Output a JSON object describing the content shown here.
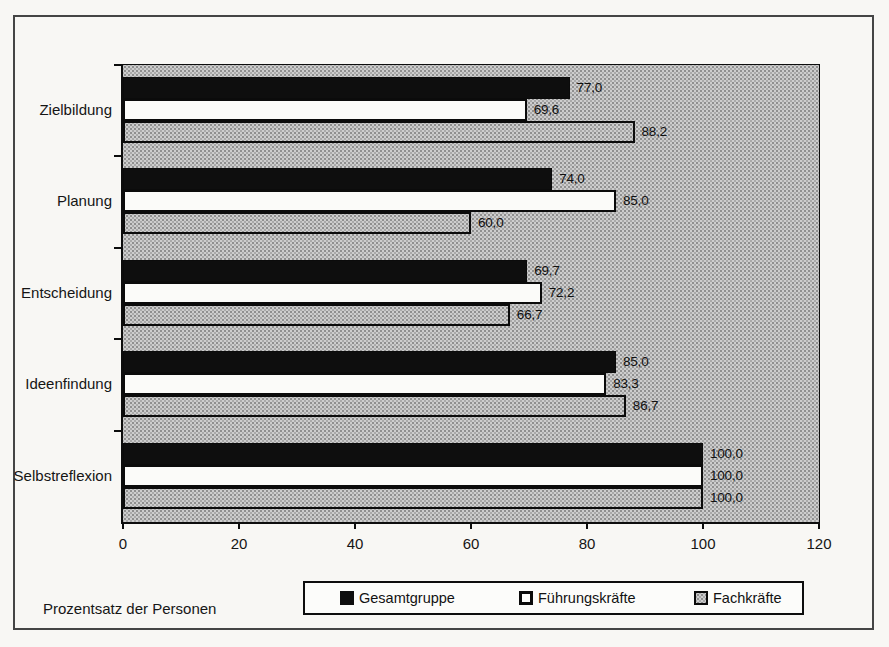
{
  "chart_data": {
    "type": "bar",
    "orientation": "horizontal",
    "categories": [
      "Zielbildung",
      "Planung",
      "Entscheidung",
      "Ideenfindung",
      "Selbstreflexion"
    ],
    "series": [
      {
        "name": "Gesamtgruppe",
        "swatch": "black",
        "color": "#0e0e0e",
        "values": [
          77.0,
          74.0,
          69.7,
          85.0,
          100.0
        ]
      },
      {
        "name": "Führungskräfte",
        "swatch": "white",
        "color": "#fbfbf9",
        "values": [
          69.6,
          85.0,
          72.2,
          83.3,
          100.0
        ]
      },
      {
        "name": "Fachkräfte",
        "swatch": "gray",
        "color": "#c9c9c9",
        "values": [
          88.2,
          60.0,
          66.7,
          86.7,
          100.0
        ]
      }
    ],
    "value_labels": [
      [
        "77,0",
        "69,6",
        "88,2"
      ],
      [
        "74,0",
        "85,0",
        "60,0"
      ],
      [
        "69,7",
        "72,2",
        "66,7"
      ],
      [
        "85,0",
        "83,3",
        "86,7"
      ],
      [
        "100,0",
        "100,0",
        "100,0"
      ]
    ],
    "xlabel": "Prozentsatz der Personen",
    "x_ticks": [
      "0",
      "20",
      "40",
      "60",
      "80",
      "100",
      "120"
    ],
    "xlim": [
      0,
      120
    ],
    "grid": false,
    "legend_position": "bottom",
    "plot_background": "#c9c9c9",
    "frame_color": "#454545"
  }
}
